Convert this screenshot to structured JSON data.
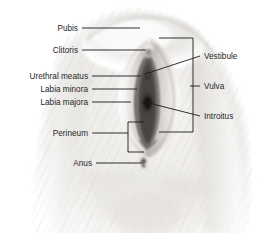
{
  "figure": {
    "type": "labeled-anatomical-illustration",
    "width": 266,
    "height": 233,
    "background_color": "#ffffff",
    "illustration_style": "grayscale airbrush / pencil shading",
    "colors": {
      "leader_line": "#1a1a1a",
      "label_text": "#1f1f1f",
      "skin_light": "#f2f1ef",
      "skin_mid": "#d9d7d4",
      "skin_shadow": "#b9b6b2",
      "cleft_dark": "#4a4744",
      "cleft_darkest": "#262320"
    }
  },
  "labels": {
    "left": [
      {
        "id": "pubis",
        "text": "Pubis",
        "x": 78,
        "y": 28
      },
      {
        "id": "clitoris",
        "text": "Clitoris",
        "x": 78,
        "y": 50
      },
      {
        "id": "urethral-meatus",
        "text": "Urethral meatus",
        "x": 88,
        "y": 76
      },
      {
        "id": "labia-minora",
        "text": "Labia minora",
        "x": 88,
        "y": 89
      },
      {
        "id": "labia-majora",
        "text": "Labia majora",
        "x": 88,
        "y": 102
      },
      {
        "id": "perineum",
        "text": "Perineum",
        "x": 88,
        "y": 133
      },
      {
        "id": "anus",
        "text": "Anus",
        "x": 92,
        "y": 163
      }
    ],
    "right": [
      {
        "id": "vestibule",
        "text": "Vestibule",
        "x": 205,
        "y": 56
      },
      {
        "id": "vulva",
        "text": "Vulva",
        "x": 205,
        "y": 86
      },
      {
        "id": "introitus",
        "text": "Introitus",
        "x": 205,
        "y": 116
      }
    ]
  },
  "leader_lines": [
    {
      "id": "pubis-line",
      "from": [
        82,
        28
      ],
      "to": [
        140,
        28
      ]
    },
    {
      "id": "clitoris-line",
      "from": [
        82,
        50
      ],
      "to": [
        146,
        50
      ]
    },
    {
      "id": "urethral-meatus-line",
      "from": [
        92,
        76
      ],
      "to": [
        140,
        76
      ]
    },
    {
      "id": "labia-minora-line",
      "from": [
        92,
        89
      ],
      "to": [
        137,
        89
      ]
    },
    {
      "id": "labia-majora-line",
      "from": [
        92,
        102
      ],
      "to": [
        131,
        102
      ]
    },
    {
      "id": "perineum-line",
      "from": [
        92,
        133
      ],
      "to": [
        128,
        133
      ]
    },
    {
      "id": "anus-line",
      "from": [
        96,
        163
      ],
      "to": [
        143,
        163
      ]
    },
    {
      "id": "vestibule-line",
      "from": [
        200,
        56
      ],
      "to": [
        144,
        74
      ]
    },
    {
      "id": "vulva-line",
      "from": [
        200,
        86
      ],
      "to": [
        191,
        86
      ]
    },
    {
      "id": "introitus-line",
      "from": [
        200,
        116
      ],
      "to": [
        143,
        101
      ]
    }
  ],
  "brackets": {
    "vulva": {
      "id": "vulva-bracket",
      "description": "right-side vertical bracket spanning the vulva region",
      "top": 38,
      "bottom": 132,
      "x": 193,
      "arm_length": 34
    },
    "perineum": {
      "id": "perineum-bracket",
      "description": "left-side vertical bracket spanning the perineum region",
      "top": 122,
      "bottom": 152,
      "x": 128,
      "arm_length": 16
    }
  },
  "anatomy_marks": {
    "anus_marker": {
      "x": 143,
      "y": 162,
      "description": "puckered anal opening mark"
    }
  }
}
